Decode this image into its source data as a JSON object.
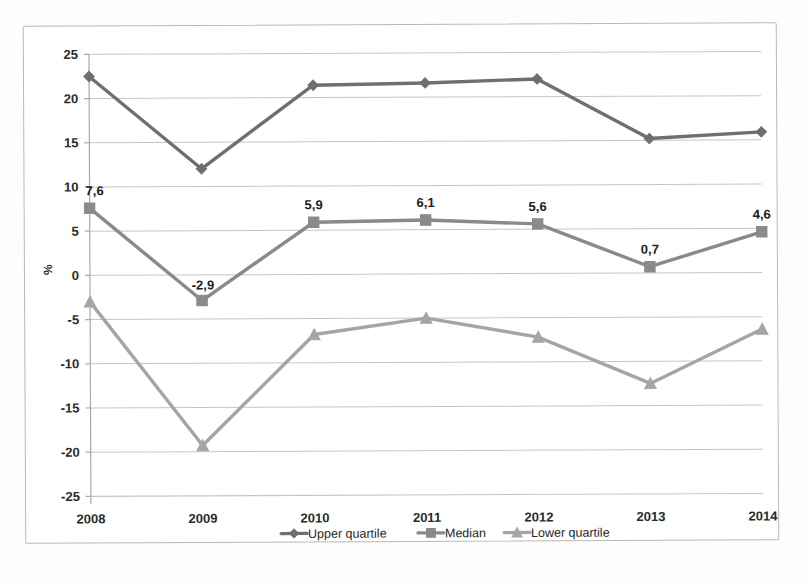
{
  "chart_data": {
    "type": "line",
    "title": "",
    "subtitle": "",
    "xlabel": "",
    "ylabel": "%",
    "categories": [
      "2008",
      "2009",
      "2010",
      "2011",
      "2012",
      "2013",
      "2014"
    ],
    "ylim": [
      -25,
      25
    ],
    "yticks": [
      "25",
      "20",
      "15",
      "10",
      "5",
      "0",
      "-5",
      "-10",
      "-15",
      "-20",
      "-25"
    ],
    "ytick_values": [
      25,
      20,
      15,
      10,
      5,
      0,
      -5,
      -10,
      -15,
      -20,
      -25
    ],
    "grid": true,
    "legend_position": "bottom",
    "series": [
      {
        "name": "Upper quartile",
        "marker": "diamond",
        "color": "#6f6f6f",
        "values": [
          22.5,
          12.0,
          21.4,
          21.6,
          22.0,
          15.2,
          15.9
        ],
        "labels": [
          "",
          "",
          "",
          "",
          "",
          "",
          ""
        ]
      },
      {
        "name": "Median",
        "marker": "square",
        "color": "#8a8a8a",
        "values": [
          7.6,
          -2.9,
          5.9,
          6.1,
          5.6,
          0.7,
          4.6
        ],
        "labels": [
          "7,6",
          "-2,9",
          "5,9",
          "6,1",
          "5,6",
          "0,7",
          "4,6"
        ]
      },
      {
        "name": "Lower quartile",
        "marker": "triangle",
        "color": "#a5a5a5",
        "values": [
          -3.0,
          -19.3,
          -6.8,
          -5.0,
          -7.2,
          -12.5,
          -6.4
        ],
        "labels": [
          "",
          "",
          "",
          "",
          "",
          "",
          ""
        ]
      }
    ]
  },
  "legend": {
    "items": [
      {
        "label": "Upper quartile",
        "color": "#6f6f6f",
        "marker": "diamond"
      },
      {
        "label": "Median",
        "color": "#8a8a8a",
        "marker": "square"
      },
      {
        "label": "Lower quartile",
        "color": "#a5a5a5",
        "marker": "triangle"
      }
    ]
  },
  "axis": {
    "y_title": "%"
  }
}
